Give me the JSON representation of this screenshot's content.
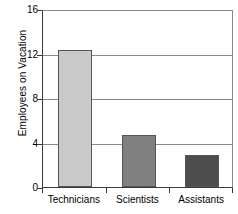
{
  "chart_data": {
    "type": "bar",
    "title": "",
    "xlabel": "",
    "ylabel": "Employees on Vacation",
    "categories": [
      "Technicians",
      "Scientists",
      "Assistants"
    ],
    "values": [
      12.3,
      4.7,
      2.9
    ],
    "bar_colors": [
      "#c9c9c9",
      "#808080",
      "#4d4d4d"
    ],
    "ylim": [
      0,
      16
    ],
    "yticks": [
      0,
      4,
      8,
      12,
      16
    ],
    "ytick_labels": [
      "0",
      "4",
      "8",
      "12",
      "16"
    ],
    "grid": true,
    "grid_axis": "y",
    "legend": false,
    "legend_position": "none",
    "axis_color": "#3a3a3a",
    "grid_color": "#8a8a8a",
    "background_color": "#ffffff"
  }
}
